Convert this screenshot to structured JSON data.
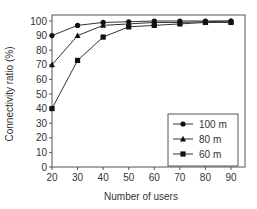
{
  "chart_data": {
    "type": "line",
    "title": "",
    "xlabel": "Number of users",
    "ylabel": "Connectivity ratio (%)",
    "x": [
      20,
      30,
      40,
      50,
      60,
      70,
      80,
      90
    ],
    "xlim": [
      20,
      90
    ],
    "ylim": [
      0,
      100
    ],
    "xticks": [
      20,
      30,
      40,
      50,
      60,
      70,
      80,
      90
    ],
    "yticks": [
      0,
      10,
      20,
      30,
      40,
      50,
      60,
      70,
      80,
      90,
      100
    ],
    "grid": false,
    "legend_position": "lower right",
    "series": [
      {
        "name": "100 m",
        "marker": "circle",
        "values": [
          90,
          97,
          99,
          99.5,
          100,
          100,
          100,
          100
        ]
      },
      {
        "name": "80 m",
        "marker": "triangle",
        "values": [
          70,
          90,
          97,
          98,
          99,
          99,
          99.5,
          100
        ]
      },
      {
        "name": "60 m",
        "marker": "square",
        "values": [
          40,
          73,
          89,
          96,
          97,
          98,
          99,
          99
        ]
      }
    ],
    "colors": {
      "line": "#333333",
      "marker": "#111111",
      "axis": "#555555"
    }
  }
}
